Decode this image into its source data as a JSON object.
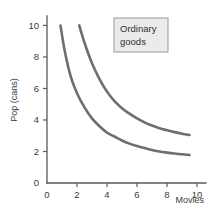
{
  "chart_data": {
    "type": "line",
    "title": "",
    "subtitle": "",
    "xlabel": "Movies",
    "ylabel": "Pop (cans)",
    "xlim": [
      0,
      10.6
    ],
    "ylim": [
      0,
      10.6
    ],
    "xticks": [
      "0",
      "2",
      "4",
      "6",
      "8",
      "10"
    ],
    "xtick_values": [
      0,
      2,
      4,
      6,
      8,
      10
    ],
    "yticks": [
      "0",
      "2",
      "4",
      "6",
      "8",
      "10"
    ],
    "ytick_values": [
      0,
      2,
      4,
      6,
      8,
      10
    ],
    "grid": false,
    "legend_position": "upper-right",
    "annotations": [
      {
        "name": "ordinary-goods-box",
        "line1": "Ordinary",
        "line2": "goods"
      }
    ],
    "series": [
      {
        "name": "indifference-curve-lower",
        "color": "#6e6e70",
        "x": [
          0.9,
          1.2,
          1.6,
          2.0,
          2.5,
          3.0,
          3.5,
          4.0,
          4.5,
          5.0,
          5.5,
          6.0,
          6.5,
          7.0,
          7.5,
          8.0,
          8.5,
          9.0,
          9.5
        ],
        "y": [
          10.0,
          8.3,
          6.7,
          5.7,
          4.8,
          4.1,
          3.6,
          3.2,
          2.95,
          2.7,
          2.5,
          2.35,
          2.22,
          2.1,
          2.0,
          1.93,
          1.87,
          1.82,
          1.78
        ]
      },
      {
        "name": "indifference-curve-upper",
        "color": "#6e6e70",
        "x": [
          2.15,
          2.5,
          3.0,
          3.5,
          4.0,
          4.5,
          5.0,
          5.5,
          6.0,
          6.5,
          7.0,
          7.5,
          8.0,
          8.5,
          9.0,
          9.5
        ],
        "y": [
          10.0,
          8.9,
          7.6,
          6.6,
          5.8,
          5.2,
          4.75,
          4.4,
          4.1,
          3.85,
          3.65,
          3.48,
          3.35,
          3.23,
          3.13,
          3.05
        ]
      }
    ]
  },
  "colors": {
    "curve": "#6e6e70",
    "axis": "#58595b",
    "legend_fill": "#ebebeb",
    "legend_border": "#9a9a9a",
    "background": "#ffffff"
  }
}
